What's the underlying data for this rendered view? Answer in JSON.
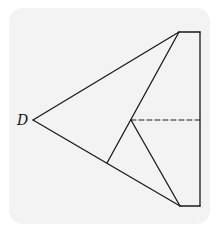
{
  "figure": {
    "labels": {
      "D": "D"
    },
    "colors": {
      "panel": "#f3f3f3",
      "stroke": "#1a1a1a"
    },
    "points": {
      "D": [
        33,
        120
      ],
      "top_left": [
        179,
        32
      ],
      "top_right": [
        200,
        32
      ],
      "bottom_left": [
        180,
        206
      ],
      "bottom_right": [
        200,
        206
      ],
      "interior": [
        131,
        120
      ],
      "foot": [
        107,
        163
      ],
      "dash_end": [
        200,
        120
      ]
    }
  }
}
